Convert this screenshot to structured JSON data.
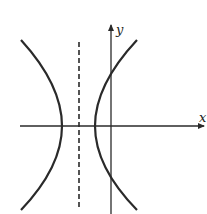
{
  "diagram": {
    "axes": {
      "x_label": "x",
      "y_label": "y"
    },
    "elements": [
      {
        "type": "axis",
        "name": "x-axis"
      },
      {
        "type": "axis",
        "name": "y-axis"
      },
      {
        "type": "dashed-line",
        "name": "center-line",
        "orientation": "vertical"
      },
      {
        "type": "curve",
        "name": "left-branch"
      },
      {
        "type": "curve",
        "name": "right-branch"
      }
    ],
    "colors": {
      "stroke": "#2a2a2a",
      "background": "#ffffff"
    }
  }
}
